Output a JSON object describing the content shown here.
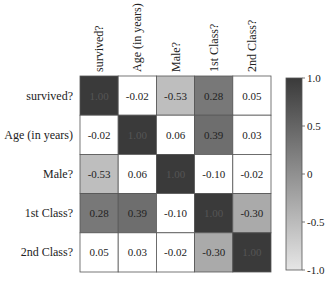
{
  "chart_data": {
    "type": "heatmap",
    "title": "",
    "row_labels": [
      "survived?",
      "Age (in years)",
      "Male?",
      "1st Class?",
      "2nd Class?"
    ],
    "col_labels": [
      "survived?",
      "Age (in years)",
      "Male?",
      "1st Class?",
      "2nd Class?"
    ],
    "values": [
      [
        1.0,
        -0.02,
        -0.53,
        0.28,
        0.05
      ],
      [
        -0.02,
        1.0,
        0.06,
        0.39,
        0.03
      ],
      [
        -0.53,
        0.06,
        1.0,
        -0.1,
        -0.02
      ],
      [
        0.28,
        0.39,
        -0.1,
        1.0,
        -0.3
      ],
      [
        0.05,
        0.03,
        -0.02,
        -0.3,
        1.0
      ]
    ],
    "display_mask": "abs_value_above_0.2_shaded",
    "value_format": "0.00",
    "colorbar": {
      "range": [
        -1.0,
        1.0
      ],
      "ticks": [
        1.0,
        0.5,
        0,
        -0.5,
        -1.0
      ],
      "tick_labels": [
        "1.0",
        "0.5",
        "0",
        "-0.5",
        "-1.0"
      ],
      "colors": {
        "high": "#3a3a3a",
        "low": "#e6e6e6"
      },
      "placement": "right"
    },
    "shade_threshold": 0.2,
    "unshaded_color": "#ffffff",
    "grid": true
  }
}
